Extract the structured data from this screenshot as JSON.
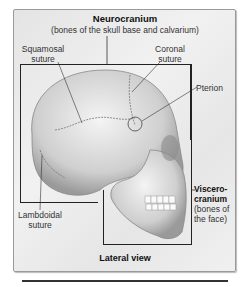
{
  "figure": {
    "neurocranium": {
      "title": "Neurocranium",
      "subtitle": "(bones of the skull base and calvarium)"
    },
    "labels": {
      "squamosal": [
        "Squamosal",
        "suture"
      ],
      "coronal": [
        "Coronal",
        "suture"
      ],
      "pterion": "Pterion",
      "lambdoidal": [
        "Lambdoidal",
        "suture"
      ],
      "viscerocranium": [
        "Viscero-",
        "cranium",
        "(bones of",
        "the face)"
      ]
    },
    "caption": "Lateral view"
  }
}
